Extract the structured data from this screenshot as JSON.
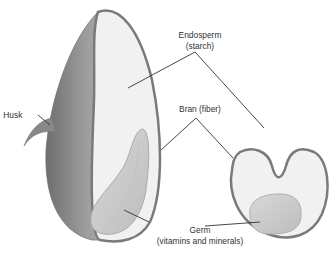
{
  "diagram": {
    "labels": {
      "husk": "Husk",
      "endosperm_line1": "Endosperm",
      "endosperm_line2": "(starch)",
      "bran": "Bran (fiber)",
      "germ_line1": "Germ",
      "germ_line2": "(vitamins and minerals)"
    },
    "views": [
      "longitudinal-section",
      "cross-section"
    ],
    "colors": {
      "bran_outline": "#7a7a7a",
      "endosperm_fill": "#f1f1f1",
      "husk_fill": "#8c8c8c",
      "germ_fill": "#cfcfcf",
      "leader_line": "#333333",
      "label_text": "#333333"
    }
  }
}
